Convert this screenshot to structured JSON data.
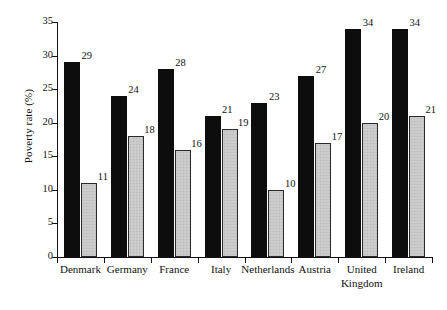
{
  "chart_data": {
    "type": "bar",
    "title": "",
    "xlabel": "",
    "ylabel": "Poverty rate (%)",
    "ylim": [
      0,
      35
    ],
    "yticks": [
      0,
      5,
      10,
      15,
      20,
      25,
      30,
      35
    ],
    "ytick_labels": [
      "0",
      "5",
      "10",
      "15",
      "20",
      "25",
      "30",
      "35"
    ],
    "grid": false,
    "legend": "none",
    "categories": [
      "Denmark",
      "Germany",
      "France",
      "Italy",
      "Netherlands",
      "Austria",
      "United Kingdom",
      "Ireland"
    ],
    "series": [
      {
        "name": "series-1-dark",
        "color": "#0d0d0d",
        "values": [
          29,
          24,
          28,
          21,
          23,
          27,
          34,
          34
        ],
        "value_labels": [
          "29",
          "24",
          "28",
          "21",
          "23",
          "27",
          "34",
          "34"
        ]
      },
      {
        "name": "series-2-light",
        "color": "#c9c9c9",
        "values": [
          11,
          18,
          16,
          19,
          10,
          17,
          20,
          21
        ],
        "value_labels": [
          "11",
          "18",
          "16",
          "19",
          "10",
          "17",
          "20",
          "21"
        ]
      }
    ]
  },
  "axis": {
    "y_title": "Poverty rate (%)"
  }
}
